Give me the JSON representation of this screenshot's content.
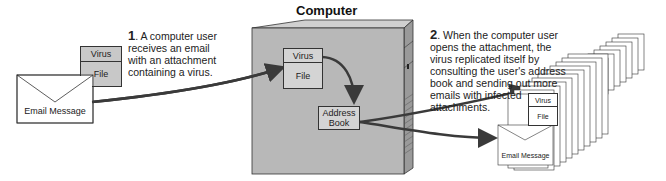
{
  "diagram": {
    "title": "Computer",
    "step1": {
      "number": "1",
      "text_lines": [
        "A computer user",
        "receives an email",
        "with an attachment",
        "containing a virus."
      ]
    },
    "step2": {
      "number": "2",
      "text_lines": [
        "When the computer user",
        "opens the attachment, the",
        "virus replicated itself by",
        "consulting the user's address",
        "book and sending out more",
        "emails with infected",
        "attachments."
      ]
    },
    "email_left": {
      "label": "Email Message",
      "attachment_top": "Virus",
      "attachment_bottom": "File"
    },
    "computer": {
      "attachment_top": "Virus",
      "attachment_bottom": "File",
      "address_book_line1": "Address",
      "address_book_line2": "Book"
    },
    "email_stack_front": {
      "label": "Email Message",
      "attachment_top": "Virus",
      "attachment_bottom": "File"
    },
    "colors": {
      "computer_face": "#b8b8b8",
      "computer_side": "#9a9a9a",
      "arrow": "#3a3a3a",
      "box_fill": "#cccccc"
    }
  }
}
